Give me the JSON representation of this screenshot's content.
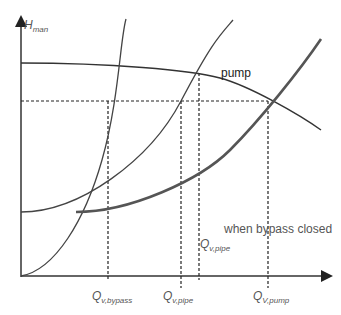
{
  "diagram": {
    "y_axis_label": {
      "main": "H",
      "sub": "man"
    },
    "curves": {
      "pump": {
        "label": "pump"
      },
      "system_closed": {
        "label": "when bypass closed"
      }
    },
    "x_labels": [
      {
        "main": "Q",
        "sub": "v,bypass"
      },
      {
        "main": "Q",
        "sub": "v,pipe"
      },
      {
        "main": "Q",
        "sub": "V,pump"
      }
    ],
    "inline_label": {
      "main": "Q",
      "sub": "v,pipe"
    },
    "colors": {
      "line": "#444444",
      "thick": "#555555",
      "text": "#555555"
    }
  }
}
